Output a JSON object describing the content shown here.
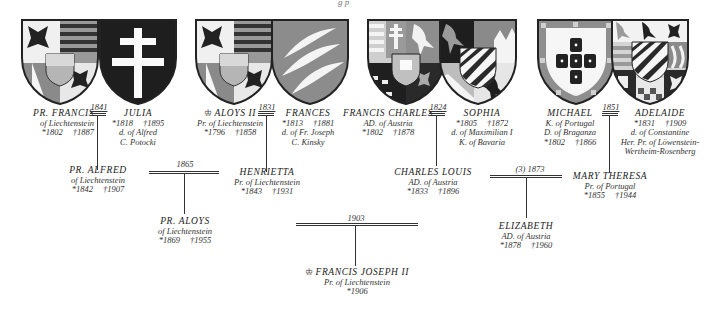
{
  "page_header": "g  p",
  "couples": [
    {
      "id": "francis-julia",
      "year": "1841",
      "husband": {
        "name": "Pr. FRANCIS",
        "lines": [
          "of Liechtenstein"
        ],
        "born": "*1802",
        "died": "†1887"
      },
      "wife": {
        "name": "JULIA",
        "born": "*1818",
        "died": "†1895",
        "lines": [
          "d. of Alfred",
          "C. Potocki"
        ]
      }
    },
    {
      "id": "aloys-frances",
      "year": "1831",
      "husband": {
        "crown": "♔",
        "name": "ALOYS II",
        "lines": [
          "Pr. of Liechtenstein"
        ],
        "born": "*1796",
        "died": "†1858"
      },
      "wife": {
        "name": "FRANCES",
        "born": "*1813",
        "died": "†1881",
        "lines": [
          "d. of Fr. Joseph",
          "C. Kinsky"
        ]
      }
    },
    {
      "id": "francischarles-sophia",
      "year": "1824",
      "husband": {
        "name": "FRANCIS CHARLES",
        "lines": [
          "AD. of Austria"
        ],
        "born": "*1802",
        "died": "†1878"
      },
      "wife": {
        "name": "SOPHIA",
        "born": "*1805",
        "died": "†1872",
        "lines": [
          "d. of Maximilian I",
          "K. of Bavaria"
        ]
      }
    },
    {
      "id": "michael-adelaide",
      "year": "1851",
      "husband": {
        "name": "MICHAEL",
        "lines": [
          "K. of Portugal",
          "D. of Braganza"
        ],
        "born": "*1802",
        "died": "†1866"
      },
      "wife": {
        "name": "ADELAIDE",
        "born": "*1831",
        "died": "†1909",
        "lines": [
          "d. of Constantine",
          "Her. Pr. of Löwenstein-",
          "Wertheim-Rosenberg"
        ]
      }
    }
  ],
  "children": {
    "alfred": {
      "name": "Pr. ALFRED",
      "lines": [
        "of Liechtenstein"
      ],
      "born": "*1842",
      "died": "†1907"
    },
    "henrietta": {
      "name": "HENRIETTA",
      "lines": [
        "Pr. of Liechtenstein"
      ],
      "born": "*1843",
      "died": "†1931"
    },
    "charles_louis": {
      "name": "CHARLES LOUIS",
      "lines": [
        "AD. of Austria"
      ],
      "born": "*1833",
      "died": "†1896"
    },
    "mary_theresa": {
      "name": "MARY THERESA",
      "lines": [
        "Pr. of Portugal"
      ],
      "born": "*1855",
      "died": "†1944"
    }
  },
  "marriages_gen2": [
    {
      "id": "alfred-henrietta",
      "year": "1865"
    },
    {
      "id": "charleslouis-marytheresa",
      "year": "(3) 1873"
    }
  ],
  "grandchildren": {
    "aloys": {
      "name": "Pr. ALOYS",
      "lines": [
        "of Liechtenstein"
      ],
      "born": "*1869",
      "died": "†1955"
    },
    "elizabeth": {
      "name": "ELIZABETH",
      "lines": [
        "AD. of Austria"
      ],
      "born": "*1878",
      "died": "†1960"
    }
  },
  "marriage_gen3": {
    "year": "1903"
  },
  "descendant": {
    "crown": "♔",
    "name": "FRANCIS JOSEPH II",
    "lines": [
      "Pr. of Liechtenstein"
    ],
    "born": "*1906"
  },
  "colors": {
    "ink": "#333333",
    "shield_dark": "#222222",
    "shield_mid": "#8a8a8a",
    "shield_light": "#cfcfcf"
  }
}
